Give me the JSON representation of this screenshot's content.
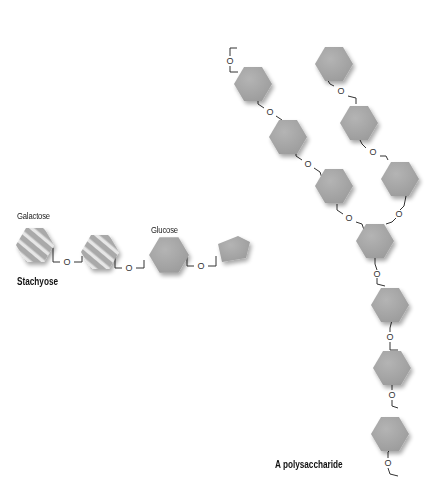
{
  "labels": {
    "galactose": "Galactose",
    "glucose": "Glucose",
    "stachyose": "Stachyose",
    "polysaccharide": "A polysaccharide",
    "oxygen": "O"
  },
  "colors": {
    "hexagon_fill": "#a9a9a9",
    "hexagon_stripe": "#e9e9e9",
    "bond_line": "#333333",
    "background": "#ffffff"
  },
  "stachyose": {
    "units": [
      "galactose (striped)",
      "galactose (striped)",
      "glucose",
      "fructose (pentagon)"
    ]
  },
  "polysaccharide": {
    "branches": 2,
    "units_main_chain": 9,
    "units_side_branch": 3
  }
}
